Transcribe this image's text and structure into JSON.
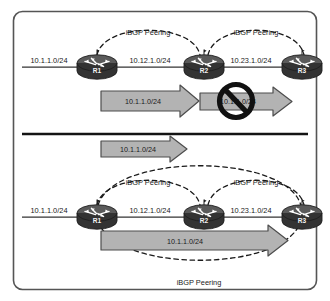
{
  "figure": {
    "border_color": "#4d4d4d",
    "background": "#ffffff",
    "divider_color": "#141414"
  },
  "palette": {
    "router_body": "#3a3a3a",
    "router_top": "#555555",
    "router_glyph": "#ffffff",
    "arrow_fill": "#b3b3b3",
    "arrow_stroke": "#4d4d4d",
    "link_color": "#333333",
    "dash_color": "#1a1a1a",
    "prohibit_color": "#111111",
    "text_color": "#1a1a1a"
  },
  "top_panel": {
    "name": "route-blocked-scenario",
    "routers": [
      {
        "id": "r1",
        "label": "R1"
      },
      {
        "id": "r2",
        "label": "R2"
      },
      {
        "id": "r3",
        "label": "R3"
      }
    ],
    "segments": [
      {
        "id": "stub-left",
        "label": "10.1.1.0/24"
      },
      {
        "id": "r1-r2",
        "label": "10.12.1.0/24"
      },
      {
        "id": "r2-r3",
        "label": "10.23.1.0/24"
      }
    ],
    "peerings": [
      {
        "id": "r1-r2-peer",
        "label": "iBGP Peering"
      },
      {
        "id": "r2-r3-peer",
        "label": "iBGP Peering"
      }
    ],
    "advertisements": [
      {
        "id": "adv-r1-r2",
        "label": "10.1.1.0/24",
        "blocked": false
      },
      {
        "id": "adv-r2-r3",
        "label": "10.1.1.0/24",
        "blocked": true
      }
    ],
    "prohibition_icon": "no-entry-icon"
  },
  "bottom_panel": {
    "name": "route-propagated-scenario",
    "routers": [
      {
        "id": "r1",
        "label": "R1"
      },
      {
        "id": "r2",
        "label": "R2"
      },
      {
        "id": "r3",
        "label": "R3"
      }
    ],
    "segments": [
      {
        "id": "stub-left",
        "label": "10.1.1.0/24"
      },
      {
        "id": "r1-r2",
        "label": "10.12.1.0/24"
      },
      {
        "id": "r2-r3",
        "label": "10.23.1.0/24"
      }
    ],
    "peerings": [
      {
        "id": "r1-r2-peer",
        "label": "iBGP Peering"
      },
      {
        "id": "r2-r3-peer",
        "label": "iBGP Peering"
      },
      {
        "id": "r1-r3-peer",
        "label": "iBGP Peering"
      }
    ],
    "advertisements": [
      {
        "id": "adv-incoming",
        "label": "10.1.1.0/24",
        "blocked": false
      },
      {
        "id": "adv-r1-r3",
        "label": "10.1.1.0/24",
        "blocked": false
      }
    ]
  }
}
